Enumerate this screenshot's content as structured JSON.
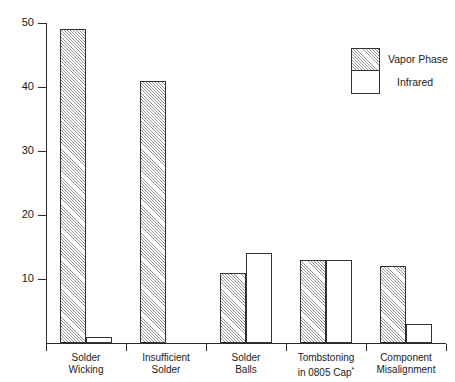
{
  "chart_data": {
    "type": "bar",
    "title": "",
    "subtitle": "",
    "xlabel": "",
    "ylabel": "",
    "ylim": [
      0,
      50
    ],
    "yticks": [
      10,
      20,
      30,
      40,
      50
    ],
    "ytick_labels": [
      "10",
      "20",
      "30",
      "40",
      "50"
    ],
    "grid": false,
    "legend_position": "top-right",
    "categories": [
      "Solder Wicking",
      "Insufficient Solder",
      "Solder Balls",
      "Tombstoning in 0805 Cap*",
      "Component Misalignment"
    ],
    "category_lines": [
      [
        "Solder",
        "Wicking"
      ],
      [
        "Insufficient",
        "Solder"
      ],
      [
        "Solder",
        "Balls"
      ],
      [
        "Tombstoning",
        "in 0805 Cap*"
      ],
      [
        "Component",
        "Misalignment"
      ]
    ],
    "series": [
      {
        "name": "Vapor Phase",
        "fill": "hatched",
        "values": [
          49,
          41,
          11,
          13,
          12
        ]
      },
      {
        "name": "Infrared",
        "fill": "white",
        "values": [
          1,
          0,
          14,
          13,
          3
        ]
      }
    ]
  },
  "legend": {
    "items": [
      {
        "label": "Vapor Phase",
        "fill": "hatched"
      },
      {
        "label": "Infrared",
        "fill": "white"
      }
    ]
  },
  "colors": {
    "axis": "#2b2b2b",
    "bar_outline": "#333333",
    "hatch": "#3c3c3c",
    "background": "#ffffff",
    "text": "#1c1c1c"
  }
}
